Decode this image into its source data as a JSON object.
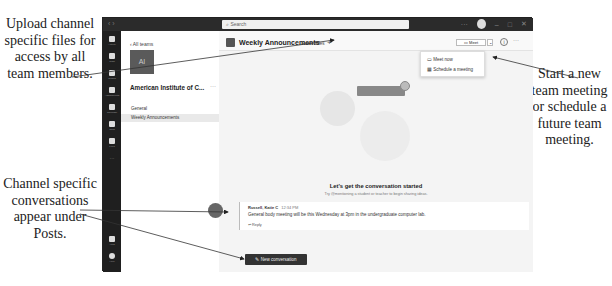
{
  "captions": {
    "left_top": "Upload channel specific files for access by all team members.",
    "left_bottom": "Channel specific conversations appear under Posts.",
    "right": "Start a new team meeting or schedule a future team meeting."
  },
  "titlebar": {
    "nav": "‹ ›",
    "search_placeholder": "Search",
    "controls": [
      "···",
      "–",
      "□",
      "✕"
    ]
  },
  "rail": {
    "items": [
      {
        "label": "Activity"
      },
      {
        "label": "Chat"
      },
      {
        "label": "Teams"
      },
      {
        "label": "Assignments"
      },
      {
        "label": "Calendar"
      },
      {
        "label": "Calls"
      },
      {
        "label": "Files"
      },
      {
        "label": "···"
      },
      {
        "label": "Apps"
      },
      {
        "label": "Help"
      }
    ]
  },
  "teams_pane": {
    "back_label": "‹  All teams",
    "team_initials": "AI",
    "team_name": "American Institute of C...",
    "more": "···",
    "channels": [
      "General",
      "Weekly Announcements"
    ]
  },
  "channel": {
    "title": "Weekly Announcements",
    "tabs": [
      "Posts",
      "Files"
    ],
    "add_tab": "+",
    "meet_label": "Meet",
    "meet_chevron": "⌄",
    "info": "i",
    "more": "···",
    "meet_menu": [
      "Meet now",
      "Schedule a meeting"
    ]
  },
  "empty_state": {
    "title": "Let's get the conversation started",
    "subtitle": "Try @mentioning a student or teacher to begin sharing ideas."
  },
  "post": {
    "author": "Russell, Katie C",
    "time": "12:34 PM",
    "body": "General body meeting will be this Wednesday at 3pm in the undergraduate computer lab.",
    "reply": "↩ Reply"
  },
  "new_conversation_label": "New conversation"
}
